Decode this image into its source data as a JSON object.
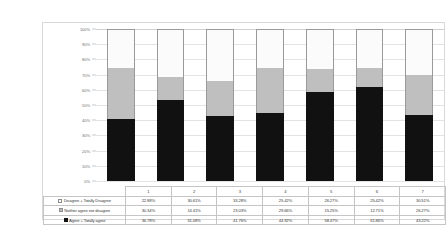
{
  "chart_data": {
    "type": "bar",
    "subtype": "100% stacked column",
    "title": "",
    "xlabel": "",
    "ylabel": "",
    "ylim": [
      0,
      100
    ],
    "grid": true,
    "legend_position": "table-left",
    "categories": [
      "1",
      "2",
      "3",
      "4",
      "5",
      "6",
      "7"
    ],
    "y_ticks": [
      "0%",
      "10%",
      "20%",
      "30%",
      "40%",
      "50%",
      "60%",
      "70%",
      "80%",
      "90%",
      "100%"
    ],
    "y_tick_values": [
      0,
      10,
      20,
      30,
      40,
      50,
      60,
      70,
      80,
      90,
      100
    ],
    "stack_order_bottom_to_top": [
      "Agree + Totally agree",
      "Neither agree nor disagree",
      "Disagree + Totally Disagree"
    ],
    "series": [
      {
        "name": "Disagree + Totally Disagree",
        "marker": "white-square",
        "color": "#FBFBFB",
        "values": [
          22.88,
          30.61,
          33.28,
          25.42,
          26.27,
          25.42,
          30.51
        ],
        "labels": [
          "22.88%",
          "30.61%",
          "33.28%",
          "25.42%",
          "26.27%",
          "25.42%",
          "30.51%"
        ]
      },
      {
        "name": "Neither agree nor disagree",
        "marker": "gray-square",
        "color": "#BFBFBF",
        "values": [
          30.34,
          14.41,
          23.03,
          29.66,
          15.25,
          12.71,
          26.27
        ],
        "labels": [
          "30.34%",
          "14.41%",
          "23.03%",
          "29.66%",
          "15.25%",
          "12.71%",
          "26.27%"
        ]
      },
      {
        "name": "Agree + Totally agree",
        "marker": "black-square",
        "color": "#111111",
        "values": [
          36.78,
          51.08,
          41.76,
          44.92,
          58.47,
          61.86,
          43.22
        ],
        "labels": [
          "36.78%",
          "51.08%",
          "41.76%",
          "44.92%",
          "58.47%",
          "61.86%",
          "43.22%"
        ]
      }
    ]
  }
}
